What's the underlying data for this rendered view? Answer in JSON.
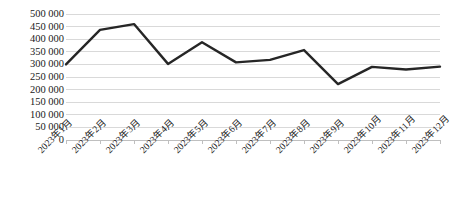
{
  "chart_data": {
    "type": "line",
    "title": "",
    "xlabel": "",
    "ylabel": "",
    "categories": [
      "2023年1月",
      "2023年2月",
      "2023年3月",
      "2023年4月",
      "2023年5月",
      "2023年6月",
      "2023年7月",
      "2023年8月",
      "2023年9月",
      "2023年10月",
      "2023年11月",
      "2023年12月"
    ],
    "values": [
      300000,
      437000,
      460000,
      302000,
      388000,
      308000,
      318000,
      357000,
      222000,
      290000,
      280000,
      291000
    ],
    "ylim": [
      0,
      500000
    ],
    "ytick_values": [
      0,
      50000,
      100000,
      150000,
      200000,
      250000,
      300000,
      350000,
      400000,
      450000,
      500000
    ],
    "ytick_labels": [
      "0",
      "50 000",
      "100 000",
      "150 000",
      "200 000",
      "250 000",
      "300 000",
      "350 000",
      "400 000",
      "450 000",
      "500 000"
    ],
    "grid": true,
    "grid_axis": "y",
    "legend": false,
    "legend_position": "none",
    "series_color": "#262626",
    "grid_color": "#d9d9d9",
    "axis_color": "#bfbfbf",
    "line_width": 2.4,
    "markers": false
  }
}
